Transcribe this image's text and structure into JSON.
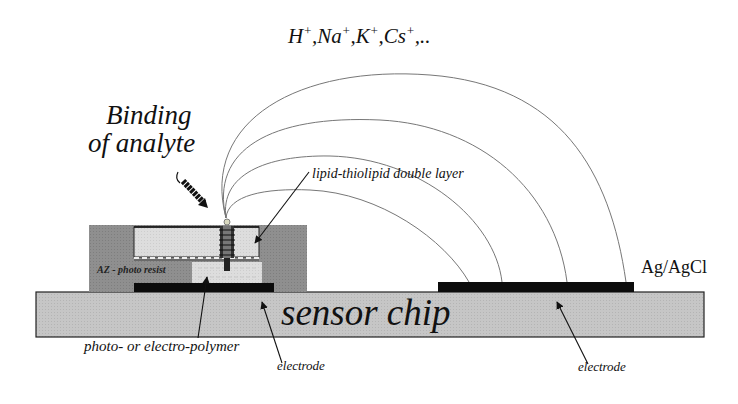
{
  "diagram": {
    "ions_label": "H⁺,Na⁺,K⁺,Cs⁺,..",
    "ions": [
      "H",
      "Na",
      "K",
      "Cs"
    ],
    "ion_charge": "+",
    "ions_trailing": ",..",
    "binding_label_line1": "Binding",
    "binding_label_line2": "of analyte",
    "lipid_label": "lipid-thiolipid double layer",
    "photoresist_label": "AZ - photo resist",
    "reference_electrode_label": "Ag/AgCl",
    "chip_label": "sensor chip",
    "polymer_label": "photo- or  electro-polymer",
    "electrode_label_left": "electrode",
    "electrode_label_right": "electrode"
  },
  "colors": {
    "chip_fill": "#c4c4c4",
    "resist_fill": "#8e8e8e",
    "lipid_fill": "#dcdcdc",
    "polymer_fill": "#e4e4e4",
    "electrode_fill": "#0c0c0c",
    "field_lines": "#777777"
  }
}
